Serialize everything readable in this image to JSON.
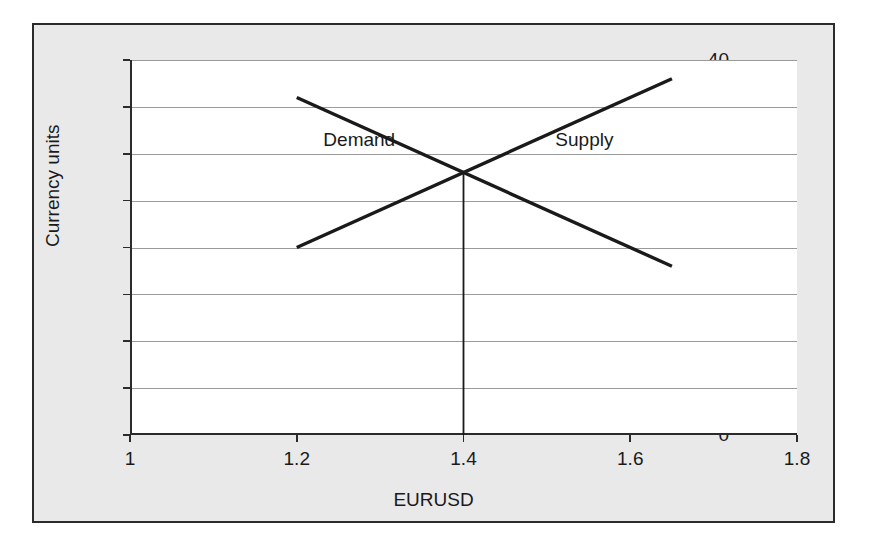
{
  "figure": {
    "background_color": "#e9e9e9",
    "plot_background_color": "#ffffff",
    "border_color": "#2b2b2b",
    "gridline_color": "#9a9a9a",
    "line_color": "#1a1a1a"
  },
  "chart_data": {
    "type": "line",
    "title": "",
    "xlabel": "EURUSD",
    "ylabel": "Currency units",
    "xlim": [
      1,
      1.8
    ],
    "ylim": [
      0,
      40
    ],
    "xticks": [
      "1",
      "1.2",
      "1.4",
      "1.6",
      "1.8"
    ],
    "xtick_values": [
      1,
      1.2,
      1.4,
      1.6,
      1.8
    ],
    "yticks": [
      "0",
      "5",
      "10",
      "15",
      "20",
      "25",
      "30",
      "35",
      "40"
    ],
    "ytick_values": [
      0,
      5,
      10,
      15,
      20,
      25,
      30,
      35,
      40
    ],
    "grid": "horizontal",
    "legend": "inline-annotations",
    "series": [
      {
        "name": "Demand",
        "points": [
          {
            "x": 1.2,
            "y": 36
          },
          {
            "x": 1.65,
            "y": 18
          }
        ],
        "label": "Demand",
        "label_x": 1.275,
        "label_y": 31.5
      },
      {
        "name": "Supply",
        "points": [
          {
            "x": 1.2,
            "y": 20
          },
          {
            "x": 1.65,
            "y": 38
          }
        ],
        "label": "Supply",
        "label_x": 1.545,
        "label_y": 31.5
      }
    ],
    "annotations": [
      {
        "name": "equilibrium-drop-line",
        "type": "vertical-segment",
        "x": 1.4,
        "y_from": 0,
        "y_to": 28
      }
    ],
    "equilibrium": {
      "x": 1.4,
      "y": 28
    }
  }
}
